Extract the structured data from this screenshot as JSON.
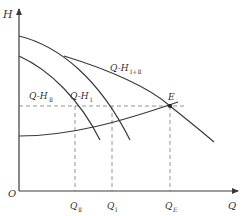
{
  "diagram": {
    "axes": {
      "y_label": "H",
      "x_label": "Q",
      "origin_label": "O"
    },
    "curves": [
      {
        "id": "q-h-2",
        "label_main": "Q-H",
        "label_sub": "Ⅱ"
      },
      {
        "id": "q-h-1",
        "label_main": "Q-H",
        "label_sub": "Ⅰ"
      },
      {
        "id": "q-h-1plus2",
        "label_main": "Q-H",
        "label_sub": "Ⅰ+Ⅱ"
      },
      {
        "id": "system-curve",
        "label_main": "",
        "label_sub": ""
      }
    ],
    "operating_point": {
      "label": "E"
    },
    "x_marks": [
      {
        "label_main": "Q",
        "label_sub": "Ⅱ"
      },
      {
        "label_main": "Q",
        "label_sub": "Ⅰ"
      },
      {
        "label_main": "Q",
        "label_sub": "E"
      }
    ]
  }
}
